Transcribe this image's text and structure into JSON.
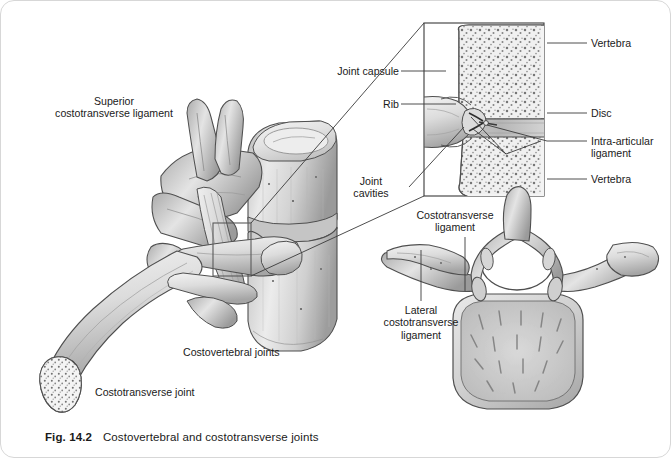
{
  "figure": {
    "number": "Fig. 14.2",
    "caption": "Costovertebral and costotransverse joints",
    "style": {
      "page_bg": "#ffffff",
      "border": "#d7d7d7",
      "ink": "#1a1a1a",
      "bone_light": "#f2f2f2",
      "bone_mid": "#d2d2d2",
      "bone_dark": "#8e8e8e",
      "outline": "#4a4a4a"
    }
  },
  "main_view": {
    "name": "lateral view of thoracic vertebrae with rib",
    "labels": [
      {
        "id": "superior-costotransverse-ligament",
        "lines": [
          "Superior",
          "costotransverse ligament"
        ]
      },
      {
        "id": "costovertebral-joints",
        "lines": [
          "Costovertebral joints"
        ]
      },
      {
        "id": "costotransverse-joint",
        "lines": [
          "Costotransverse joint"
        ]
      }
    ]
  },
  "inset_view": {
    "name": "sectioned costovertebral joint detail",
    "labels_left": [
      {
        "id": "joint-capsule",
        "lines": [
          "Joint capsule"
        ]
      },
      {
        "id": "rib",
        "lines": [
          "Rib"
        ]
      },
      {
        "id": "joint-cavities",
        "lines": [
          "Joint",
          "cavities"
        ]
      }
    ],
    "labels_right": [
      {
        "id": "vertebra-upper",
        "lines": [
          "Vertebra"
        ]
      },
      {
        "id": "disc",
        "lines": [
          "Disc"
        ]
      },
      {
        "id": "intra-articular-ligament",
        "lines": [
          "Intra-articular",
          "ligament"
        ]
      },
      {
        "id": "vertebra-lower",
        "lines": [
          "Vertebra"
        ]
      }
    ]
  },
  "axial_view": {
    "name": "superior view of thoracic vertebra with ribs",
    "labels": [
      {
        "id": "costotransverse-ligament",
        "lines": [
          "Costotransverse",
          "ligament"
        ]
      },
      {
        "id": "lateral-costotransverse-ligament",
        "lines": [
          "Lateral",
          "costotransverse",
          "ligament"
        ]
      }
    ]
  },
  "text": {
    "superior": "Superior",
    "costotransverse_ligament_line2": "costotransverse ligament",
    "costovertebral_joints": "Costovertebral joints",
    "costotransverse_joint": "Costotransverse joint",
    "joint_capsule": "Joint capsule",
    "rib": "Rib",
    "joint": "Joint",
    "cavities": "cavities",
    "vertebra_upper": "Vertebra",
    "disc": "Disc",
    "intra_articular": "Intra-articular",
    "ligament": "ligament",
    "vertebra_lower": "Vertebra",
    "ct_lig_l1": "Costotransverse",
    "ct_lig_l2": "ligament",
    "lat_l1": "Lateral",
    "lat_l2": "costotransverse",
    "lat_l3": "ligament"
  }
}
